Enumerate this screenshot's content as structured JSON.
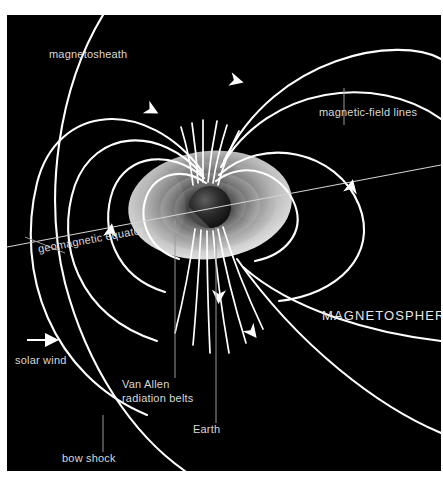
{
  "figure": {
    "background_color": "#ffffff",
    "panel_color": "#000000",
    "line_color": "#ffffff",
    "label_color": "#d8d8d8"
  },
  "labels": {
    "magnetosheath": "magnetosheath",
    "magnetic_field_lines": "magnetic-field lines",
    "geomagnetic_equator": "geomagnetic equator",
    "magnetosphere": "MAGNETOSPHERE",
    "solar_wind": "solar wind",
    "van_allen_line1": "Van Allen",
    "van_allen_line2": "radiation belts",
    "earth": "Earth",
    "bow_shock": "bow shock"
  },
  "diagram_elements": {
    "earth_globe": "earth-sphere",
    "radiation_belt_torus": "van-allen-belt-torus",
    "field_line_count": 10,
    "arrow_count": 6,
    "solar_wind_arrow_direction": "right",
    "equator_tilt_degrees": -5.5
  }
}
